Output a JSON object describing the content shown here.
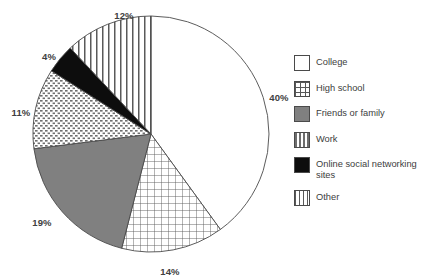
{
  "chart_data": {
    "type": "pie",
    "title": "",
    "subtitle": "",
    "xlabel": "",
    "ylabel": "",
    "legend_position": "right",
    "grid": false,
    "units": "percent",
    "categories": [
      "College",
      "High school",
      "Friends or family",
      "Work",
      "Online social networking sites",
      "Other"
    ],
    "values": [
      40,
      14,
      19,
      11,
      4,
      12
    ],
    "labels": [
      "40%",
      "14%",
      "19%",
      "11%",
      "4%",
      "12%"
    ],
    "slices": [
      {
        "label": "College",
        "value": 40,
        "value_label": "40%",
        "fill": "#ffffff",
        "pattern": "solid-white",
        "start_angle_deg": 0,
        "end_angle_deg": 144,
        "label_x": 279,
        "label_y": 98
      },
      {
        "label": "High school",
        "value": 14,
        "value_label": "14%",
        "fill": "#ffffff",
        "pattern": "grid",
        "start_angle_deg": 144,
        "end_angle_deg": 194.4,
        "label_x": 170,
        "label_y": 272
      },
      {
        "label": "Friends or family",
        "value": 19,
        "value_label": "19%",
        "fill": "#808080",
        "pattern": "solid-gray",
        "start_angle_deg": 194.4,
        "end_angle_deg": 262.8,
        "label_x": 42,
        "label_y": 223
      },
      {
        "label": "Work",
        "value": 11,
        "value_label": "11%",
        "fill": "#ffffff",
        "pattern": "dots",
        "start_angle_deg": 262.8,
        "end_angle_deg": 302.4,
        "label_x": 21,
        "label_y": 113
      },
      {
        "label": "Online social networking sites",
        "value": 4,
        "value_label": "4%",
        "fill": "#0d0d0d",
        "pattern": "solid-black",
        "start_angle_deg": 302.4,
        "end_angle_deg": 316.8,
        "label_x": 49,
        "label_y": 57
      },
      {
        "label": "Other",
        "value": 12,
        "value_label": "12%",
        "fill": "#ffffff",
        "pattern": "vertical-stripes",
        "start_angle_deg": 316.8,
        "end_angle_deg": 360,
        "label_x": 124,
        "label_y": 16
      }
    ],
    "geometry": {
      "center_x": 151,
      "center_y": 134,
      "radius": 118
    },
    "colors": {
      "outline": "#4a4a4a",
      "gray_fill": "#808080",
      "black_fill": "#0d0d0d",
      "white_fill": "#ffffff",
      "label_text": "#404040",
      "background": "#ffffff"
    }
  },
  "legend": {
    "items": [
      {
        "label": "College",
        "pattern": "solid-white"
      },
      {
        "label": "High school",
        "pattern": "grid"
      },
      {
        "label": "Friends or family",
        "pattern": "solid-gray"
      },
      {
        "label": "Work",
        "pattern": "dots"
      },
      {
        "label": "Online social networking\nsites",
        "pattern": "solid-black"
      },
      {
        "label": "Other",
        "pattern": "vertical-stripes"
      }
    ]
  }
}
